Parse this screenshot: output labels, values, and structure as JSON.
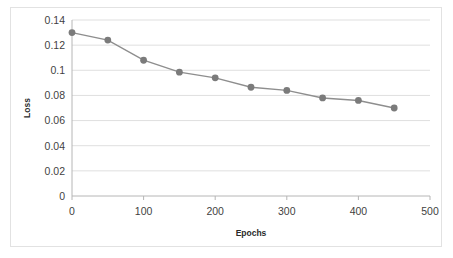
{
  "chart_data": {
    "type": "line",
    "title": "",
    "xlabel": "Epochs",
    "ylabel": "Loss",
    "x": [
      0,
      50,
      100,
      150,
      200,
      250,
      300,
      350,
      400,
      450
    ],
    "values": [
      0.13,
      0.124,
      0.108,
      0.0985,
      0.094,
      0.0865,
      0.084,
      0.078,
      0.076,
      0.07
    ],
    "series": [
      {
        "name": "Loss",
        "values": [
          0.13,
          0.124,
          0.108,
          0.0985,
          0.094,
          0.0865,
          0.084,
          0.078,
          0.076,
          0.07
        ]
      }
    ],
    "xlim": [
      0,
      500
    ],
    "ylim": [
      0,
      0.14
    ],
    "xticks": [
      0,
      100,
      200,
      300,
      400,
      500
    ],
    "xtick_labels": [
      "0",
      "100",
      "200",
      "300",
      "400",
      "500"
    ],
    "yticks": [
      0,
      0.02,
      0.04,
      0.06,
      0.08,
      0.1,
      0.12,
      0.14
    ],
    "ytick_labels": [
      "0",
      "0.02",
      "0.04",
      "0.06",
      "0.08",
      "0.1",
      "0.12",
      "0.14"
    ],
    "grid": "horizontal",
    "legend": "none",
    "line_color": "#8e8e8e",
    "marker_color": "#7b7b7b",
    "gridline_color": "#dfdfdf",
    "border_color": "#e2e2e2"
  }
}
